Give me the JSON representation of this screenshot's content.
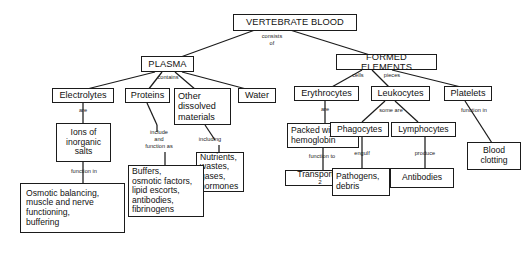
{
  "diagram": {
    "type": "concept-map",
    "stroke_color": "#1b1b1b",
    "background_color": "#ffffff",
    "nodes": {
      "root": "VERTEBRATE BLOOD",
      "plasma": "PLASMA",
      "formed_elements": "FORMED ELEMENTS",
      "electrolytes": "Electrolytes",
      "proteins": "Proteins",
      "other_dissolved": "Other\ndissolved\nmaterials",
      "water": "Water",
      "erythrocytes": "Erythrocytes",
      "leukocytes": "Leukocytes",
      "platelets": "Platelets",
      "ions": "Ions of\ninorganic\nsalts",
      "buffers": "Buffers,\nosmotic factors,\nlipid escorts,\nantibodies,\nfibrinogens",
      "nutrients": "Nutrients,\nwastes,\ngases,\nhormones",
      "packed_hemoglobin": "Packed with\nhemoglobin",
      "phagocytes": "Phagocytes",
      "lymphocytes": "Lymphocytes",
      "blood_clotting": "Blood\nclotting",
      "osmotic": "Osmotic balancing,\nmuscle and  nerve\nfunctioning,\nbuffering",
      "transport_o2_pre": "Transport O",
      "transport_o2_sub": "2",
      "pathogens": "Pathogens,\ndebris",
      "antibodies": "Antibodies"
    },
    "link_labels": {
      "consists_of": "consists\nof",
      "contains": "contains",
      "cells": "cells",
      "pieces": "pieces",
      "are_electrolytes": "are",
      "include_function_as": "include\nand\nfunction as",
      "including": "including",
      "are_erythrocytes": "are",
      "some_are": "some are",
      "function_in_platelets": "function in",
      "function_in_ions": "function in",
      "function_to": "function to",
      "engulf": "engulf",
      "produce": "produce"
    }
  }
}
